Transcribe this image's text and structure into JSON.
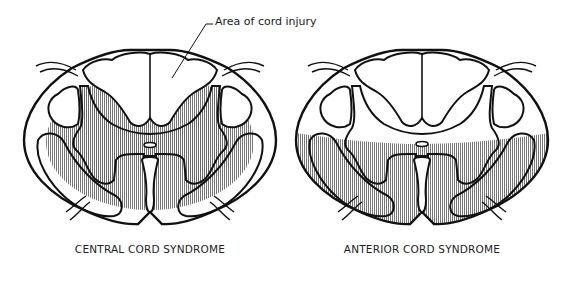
{
  "figure": {
    "callout": {
      "label": "Area of cord injury"
    },
    "panels": [
      {
        "id": "central",
        "caption": "CENTRAL CORD SYNDROME",
        "injury_region": "central (gray matter and surrounding white matter, center of cord)"
      },
      {
        "id": "anterior",
        "caption": "ANTERIOR CORD SYNDROME",
        "injury_region": "anterior two-thirds of cord"
      }
    ],
    "colors": {
      "stroke": "#111111",
      "hatch": "#555555",
      "background": "#ffffff"
    }
  }
}
